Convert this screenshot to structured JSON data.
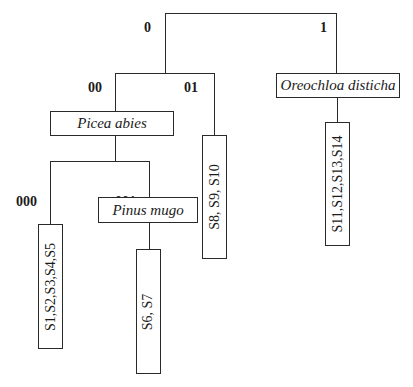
{
  "diagram": {
    "type": "binary classification tree",
    "branch_codes": {
      "root_left": "0",
      "root_right": "1",
      "left_left": "00",
      "left_right": "01",
      "left_left_left": "000",
      "left_left_right": "001"
    },
    "taxa": {
      "picea": "Picea abies",
      "pinus": "Pinus mugo",
      "oreochloa": "Oreochloa disticha"
    },
    "leaves": {
      "leaf_000": "S1,S2,S3,S4,S5",
      "leaf_001": "S6, S7",
      "leaf_01": "S8, S9, S10",
      "leaf_1": "S11,S12,S13,S14"
    }
  }
}
